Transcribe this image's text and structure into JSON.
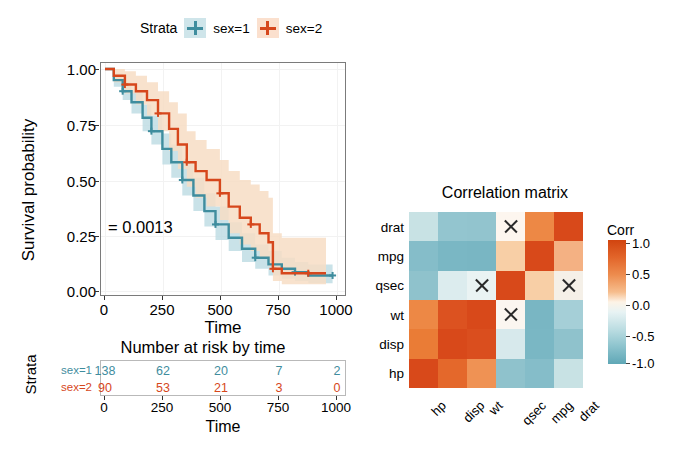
{
  "survival_plot": {
    "legend": {
      "title": "Strata",
      "entries": [
        {
          "label": "sex=1",
          "color": "#3f8d9e",
          "key_bg": "#cfe5ea"
        },
        {
          "label": "sex=2",
          "color": "#d6471c",
          "key_bg": "#fbe0ce"
        }
      ]
    },
    "y_axis": {
      "label": "Survival probability",
      "ticks": [
        "0.00",
        "0.25",
        "0.50",
        "0.75",
        "1.00"
      ]
    },
    "x_axis": {
      "label": "Time",
      "ticks": [
        "0",
        "250",
        "500",
        "750",
        "1000"
      ]
    },
    "pvalue_annotation": "= 0.0013"
  },
  "risk_table": {
    "title": "Number at risk by time",
    "y_axis_label": "Strata",
    "x_axis_label": "Time",
    "x_ticks": [
      "0",
      "250",
      "500",
      "750",
      "1000"
    ],
    "rows": [
      {
        "label": "sex=1",
        "color": "#3f8d9e",
        "values": [
          "138",
          "62",
          "20",
          "7",
          "2"
        ]
      },
      {
        "label": "sex=2",
        "color": "#d6471c",
        "values": [
          "90",
          "53",
          "21",
          "3",
          "0"
        ]
      }
    ]
  },
  "correlation_matrix": {
    "title": "Correlation matrix",
    "legend_title": "Corr",
    "legend_ticks": [
      "1.0",
      "0.5",
      "0.0",
      "-0.5",
      "-1.0"
    ]
  },
  "chart_data": [
    {
      "type": "line",
      "title": "",
      "subtitle": "Kaplan-Meier survival curves",
      "xlabel": "Time",
      "ylabel": "Survival probability",
      "xlim": [
        0,
        1050
      ],
      "ylim": [
        0,
        1
      ],
      "xticks": [
        0,
        250,
        500,
        750,
        1000
      ],
      "yticks": [
        0,
        0.25,
        0.5,
        0.75,
        1.0
      ],
      "grid": true,
      "legend_position": "top",
      "annotations": [
        "= 0.0013"
      ],
      "series": [
        {
          "name": "sex=1",
          "color": "#3f8d9e",
          "band_color": "#bfdde4",
          "x": [
            0,
            40,
            80,
            120,
            170,
            210,
            260,
            300,
            350,
            400,
            450,
            500,
            560,
            620,
            680,
            740,
            800,
            860,
            920,
            1000,
            1030
          ],
          "y": [
            1.0,
            0.95,
            0.9,
            0.85,
            0.78,
            0.72,
            0.64,
            0.58,
            0.5,
            0.43,
            0.36,
            0.3,
            0.24,
            0.19,
            0.15,
            0.12,
            0.1,
            0.085,
            0.07,
            0.07,
            0.07
          ],
          "ci_lower": [
            1.0,
            0.92,
            0.86,
            0.8,
            0.72,
            0.66,
            0.57,
            0.51,
            0.43,
            0.36,
            0.29,
            0.23,
            0.18,
            0.13,
            0.1,
            0.07,
            0.055,
            0.045,
            0.035,
            0.035,
            0.035
          ],
          "ci_upper": [
            1.0,
            0.98,
            0.94,
            0.9,
            0.84,
            0.79,
            0.71,
            0.66,
            0.58,
            0.51,
            0.44,
            0.38,
            0.31,
            0.26,
            0.21,
            0.18,
            0.15,
            0.13,
            0.12,
            0.12,
            0.12
          ]
        },
        {
          "name": "sex=2",
          "color": "#d6471c",
          "band_color": "#f7ddc4",
          "x": [
            0,
            40,
            90,
            140,
            190,
            240,
            290,
            330,
            370,
            410,
            460,
            520,
            560,
            610,
            660,
            700,
            740,
            760,
            800,
            860,
            920,
            960,
            1000
          ],
          "y": [
            1.0,
            0.97,
            0.93,
            0.9,
            0.86,
            0.8,
            0.73,
            0.66,
            0.58,
            0.54,
            0.5,
            0.44,
            0.38,
            0.33,
            0.3,
            0.26,
            0.22,
            0.1,
            0.08,
            0.08,
            0.08,
            0.08,
            0.08
          ],
          "ci_lower": [
            1.0,
            0.94,
            0.89,
            0.84,
            0.79,
            0.72,
            0.63,
            0.55,
            0.47,
            0.42,
            0.38,
            0.32,
            0.26,
            0.21,
            0.18,
            0.15,
            0.11,
            0.045,
            0.03,
            0.03,
            0.03,
            0.03,
            0.03
          ],
          "ci_upper": [
            1.0,
            1.0,
            0.99,
            0.97,
            0.94,
            0.9,
            0.85,
            0.8,
            0.72,
            0.68,
            0.64,
            0.59,
            0.54,
            0.5,
            0.48,
            0.45,
            0.42,
            0.26,
            0.24,
            0.24,
            0.24,
            0.24,
            0.24
          ]
        }
      ]
    },
    {
      "type": "table",
      "title": "Number at risk by time",
      "xlabel": "Time",
      "ylabel": "Strata",
      "categories": [
        "0",
        "250",
        "500",
        "750",
        "1000"
      ],
      "series": [
        {
          "name": "sex=1",
          "values": [
            138,
            62,
            20,
            7,
            2
          ]
        },
        {
          "name": "sex=2",
          "values": [
            90,
            53,
            21,
            3,
            0
          ]
        }
      ]
    },
    {
      "type": "heatmap",
      "title": "Correlation matrix",
      "xlabel": "",
      "ylabel": "",
      "legend_title": "Corr",
      "zlim": [
        -1.0,
        1.0
      ],
      "legend_ticks": [
        1.0,
        0.5,
        0.0,
        -0.5,
        -1.0
      ],
      "x_categories": [
        "hp",
        "disp",
        "wt",
        "qsec",
        "mpg",
        "drat"
      ],
      "y_categories": [
        "drat",
        "mpg",
        "qsec",
        "wt",
        "disp",
        "hp"
      ],
      "insignificant_marker": "X",
      "rows": [
        {
          "label": "drat",
          "values": [
            -0.45,
            -0.71,
            -0.71,
            0.09,
            0.68,
            1.0
          ],
          "colors": [
            "#c8e2e4",
            "#93c5cf",
            "#92c4ce",
            "#fdf6ef",
            "#ed8845",
            "#d8491a"
          ],
          "marked": [
            false,
            false,
            false,
            true,
            false,
            false
          ]
        },
        {
          "label": "mpg",
          "values": [
            -0.78,
            -0.85,
            -0.87,
            0.42,
            1.0,
            0.68
          ],
          "colors": [
            "#85bdc9",
            "#7ab7c4",
            "#79b6c3",
            "#f8cfa6",
            "#d8491a",
            "#f4b183"
          ],
          "marked": [
            false,
            false,
            false,
            false,
            false,
            false
          ]
        },
        {
          "label": "qsec",
          "values": [
            -0.71,
            -0.43,
            -0.17,
            1.0,
            0.42,
            0.09
          ],
          "colors": [
            "#8fc2cc",
            "#dcecee",
            "#eaf3f3",
            "#d8491a",
            "#f8cfa6",
            "#f5f0e8"
          ],
          "marked": [
            false,
            false,
            true,
            false,
            false,
            true
          ]
        },
        {
          "label": "wt",
          "values": [
            0.66,
            0.89,
            1.0,
            -0.17,
            -0.87,
            -0.71
          ],
          "colors": [
            "#ed8845",
            "#dc5220",
            "#d8491a",
            "#fbf6f0",
            "#79b6c3",
            "#a5cfd7"
          ],
          "marked": [
            false,
            false,
            false,
            true,
            false,
            false
          ]
        },
        {
          "label": "disp",
          "values": [
            0.79,
            1.0,
            0.89,
            -0.43,
            -0.85,
            -0.71
          ],
          "colors": [
            "#ea7c36",
            "#d8491a",
            "#da4e1e",
            "#d7e9ec",
            "#7ab7c4",
            "#8fc2cc"
          ],
          "marked": [
            false,
            false,
            false,
            false,
            false,
            false
          ]
        },
        {
          "label": "hp",
          "values": [
            1.0,
            0.79,
            0.66,
            -0.71,
            -0.78,
            -0.45
          ],
          "colors": [
            "#d8491a",
            "#e4682b",
            "#ef9254",
            "#8fc2cc",
            "#85bdc9",
            "#c8e2e4"
          ],
          "marked": [
            false,
            false,
            false,
            false,
            false,
            false
          ]
        }
      ]
    }
  ]
}
